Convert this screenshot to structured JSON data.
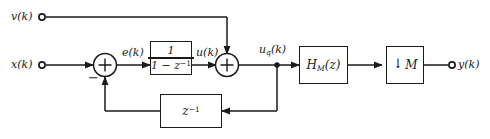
{
  "diagram": {
    "colors": {
      "line": "#1a1a1a",
      "background": "#ffffff",
      "node_fill": "#ffffff"
    },
    "signals": {
      "v_label": "v(k)",
      "x_label": "x(k)",
      "e_label": "e(k)",
      "u_label": "u(k)",
      "uq_label_base": "u",
      "uq_label_sub": "q",
      "uq_label_tail": "(k)",
      "y_label": "y(k)"
    },
    "blocks": {
      "integrator": {
        "numerator": "1",
        "denominator_base": "1 − z",
        "denominator_exp": "−1"
      },
      "delay": {
        "base": "z",
        "exp": "−1"
      },
      "filter": {
        "base": "H",
        "sub": "M",
        "tail": "(z)"
      },
      "downsampler": {
        "arrow": "↓",
        "factor": "M"
      }
    },
    "adders": {
      "first": {
        "plus": "+",
        "minus": "−"
      },
      "second": {
        "plus": "+"
      }
    }
  }
}
